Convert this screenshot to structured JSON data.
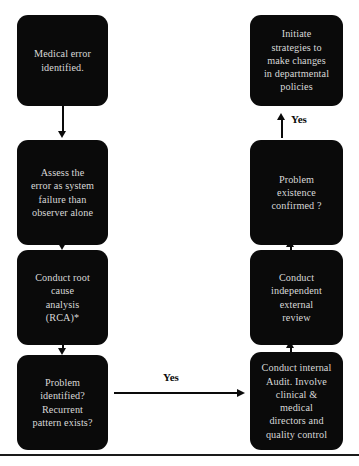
{
  "diagram": {
    "colors": {
      "node_fill": "#0a0a0a",
      "node_text": "#d8d8d8",
      "connector": "#0a0a0a",
      "background": "#ffffff"
    },
    "left_column": [
      {
        "id": "medical-error-identified",
        "text": "Medical error\nidentified."
      },
      {
        "id": "assess-error",
        "text": "Assess the\nerror as system\nfailure than\nobserver alone"
      },
      {
        "id": "conduct-rca",
        "text": "Conduct root\ncause\nanalysis\n(RCA)*"
      },
      {
        "id": "problem-identified",
        "text": "Problem\nidentified?\nRecurrent\npattern exists?"
      }
    ],
    "right_column": [
      {
        "id": "initiate-strategies",
        "text": "Initiate\nstrategies to\nmake changes\nin departmental\npolicies"
      },
      {
        "id": "problem-existence-confirmed",
        "text": "Problem\nexistence\nconfirmed ?"
      },
      {
        "id": "conduct-external-review",
        "text": "Conduct\nindependent\nexternal\nreview"
      },
      {
        "id": "conduct-internal-audit",
        "text": "Conduct internal\nAudit. Involve\nclinical &\nmedical\ndirectors and\nquality control"
      }
    ],
    "edge_labels": {
      "horizontal_yes": "Yes",
      "vertical_yes": "Yes"
    }
  }
}
